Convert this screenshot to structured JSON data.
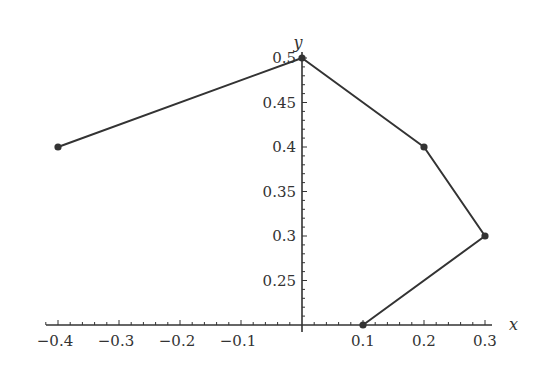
{
  "chart_data": {
    "type": "line",
    "title": "",
    "xlabel": "x",
    "ylabel": "y",
    "xlim": [
      -0.42,
      0.31
    ],
    "ylim": [
      0.2,
      0.5
    ],
    "axes_origin": [
      0,
      0.2
    ],
    "grid": false,
    "legend": null,
    "x_ticks": [
      -0.4,
      -0.3,
      -0.2,
      -0.1,
      0.1,
      0.2,
      0.3
    ],
    "x_tick_labels": [
      "−0.4",
      "−0.3",
      "−0.2",
      "−0.1",
      "0.1",
      "0.2",
      "0.3"
    ],
    "y_ticks": [
      0.25,
      0.3,
      0.35,
      0.4,
      0.45,
      0.5
    ],
    "y_tick_labels": [
      "0.25",
      "0.3",
      "0.35",
      "0.4",
      "0.45",
      "0.5"
    ],
    "series": [
      {
        "name": "path",
        "markers": true,
        "color": "#333333",
        "points": [
          {
            "x": -0.4,
            "y": 0.4
          },
          {
            "x": 0.0,
            "y": 0.5
          },
          {
            "x": 0.2,
            "y": 0.4
          },
          {
            "x": 0.3,
            "y": 0.3
          },
          {
            "x": 0.1,
            "y": 0.2
          }
        ]
      }
    ]
  },
  "style": {
    "line_color": "#333333",
    "axis_color": "#333333",
    "background": "#ffffff"
  }
}
